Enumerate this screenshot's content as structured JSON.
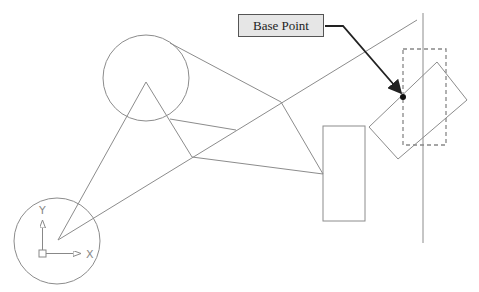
{
  "caption_fragment": "",
  "callout": {
    "label": "Base Point"
  },
  "ucs": {
    "x_label": "X",
    "y_label": "Y"
  },
  "colors": {
    "geometry": "#8c8c8c",
    "callout_fill": "#e6e6e6",
    "callout_border": "#555555",
    "arrow": "#222222",
    "dashed": "#888888"
  },
  "geometry": {
    "circles": [
      {
        "name": "upper-circle",
        "cx": 146,
        "cy": 78,
        "r": 43
      },
      {
        "name": "origin-circle",
        "cx": 57,
        "cy": 241,
        "r": 43
      }
    ],
    "lines": [
      {
        "name": "long-diagonal",
        "x1": 58,
        "y1": 240,
        "x2": 417,
        "y2": 20
      },
      {
        "name": "triangle-left",
        "x1": 58,
        "y1": 240,
        "x2": 146,
        "y2": 82
      },
      {
        "name": "triangle-right",
        "x1": 146,
        "y1": 82,
        "x2": 192,
        "y2": 157
      },
      {
        "name": "tangent-top",
        "x1": 170,
        "y1": 43,
        "x2": 281,
        "y2": 102
      },
      {
        "name": "circle-to-diagonal",
        "x1": 170,
        "y1": 119,
        "x2": 236,
        "y2": 130
      },
      {
        "name": "quad-right",
        "x1": 281,
        "y1": 102,
        "x2": 323,
        "y2": 174
      },
      {
        "name": "quad-bottom",
        "x1": 192,
        "y1": 157,
        "x2": 323,
        "y2": 174
      },
      {
        "name": "vertical-line",
        "x1": 423,
        "y1": 13,
        "x2": 423,
        "y2": 243
      }
    ],
    "rectangle": {
      "x": 323,
      "y": 126,
      "w": 42,
      "h": 95
    },
    "rotated_rectangle": "437,62 467,100 398,159 369,127",
    "dashed_rectangle": {
      "x": 403,
      "y": 49,
      "w": 43,
      "h": 96
    },
    "base_point": {
      "x": 403,
      "y": 97
    }
  }
}
